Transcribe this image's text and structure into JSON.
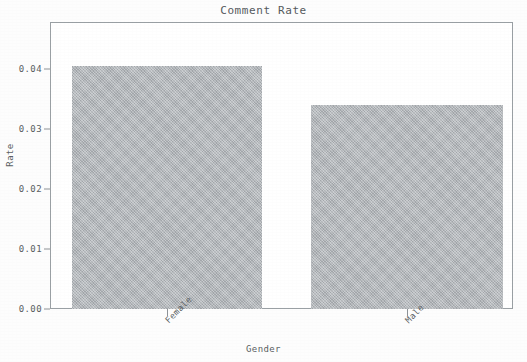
{
  "chart_data": {
    "type": "bar",
    "title": "Comment Rate",
    "xlabel": "Gender",
    "ylabel": "Rate",
    "categories": [
      "Female",
      "Male"
    ],
    "values": [
      0.0405,
      0.0339
    ],
    "ylim": [
      0.0,
      0.0478
    ],
    "ytick_labels": [
      "0.00",
      "0.01",
      "0.02",
      "0.03",
      "0.04"
    ],
    "ytick_values": [
      0.0,
      0.01,
      0.02,
      0.03,
      0.04
    ],
    "grid": false,
    "legend": "none",
    "bar_color": "#b2b6ba",
    "axis_color": "#9aa0a4",
    "text_color": "#5a5f63",
    "xtick_rotation": -45
  },
  "ytick": {
    "t0": "0.00",
    "t1": "0.01",
    "t2": "0.02",
    "t3": "0.03",
    "t4": "0.04"
  },
  "xtick": {
    "c0": "Female",
    "c1": "Male"
  }
}
